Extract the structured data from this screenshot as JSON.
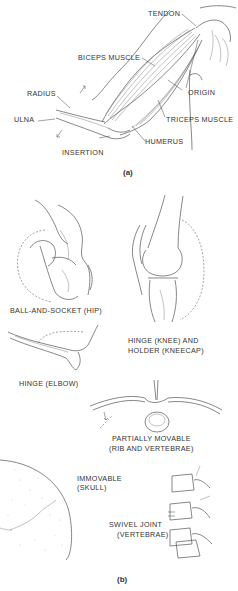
{
  "figure_a": {
    "caption": "(a)",
    "labels": {
      "tendon": "TENDON",
      "biceps": "BICEPS MUSCLE",
      "radius": "RADIUS",
      "origin": "ORIGIN",
      "ulna": "ULNA",
      "triceps": "TRICEPS MUSCLE",
      "humerus": "HUMERUS",
      "insertion": "INSERTION"
    }
  },
  "figure_b": {
    "caption": "(b)",
    "joints": [
      {
        "id": "hip",
        "line1": "BALL-AND-SOCKET  (HIP)",
        "line2": ""
      },
      {
        "id": "knee",
        "line1": "HINGE  (KNEE)  AND",
        "line2": "HOLDER  (KNEECAP)"
      },
      {
        "id": "elbow",
        "line1": "HINGE  (ELBOW)",
        "line2": ""
      },
      {
        "id": "rib",
        "line1": "PARTIALLY  MOVABLE",
        "line2": "(RIB  AND  VERTEBRAE)"
      },
      {
        "id": "skull",
        "line1": "IMMOVABLE",
        "line2": "(SKULL)"
      },
      {
        "id": "vertebrae",
        "line1": "SWIVEL  JOINT",
        "line2": "(VERTEBRAE)"
      }
    ]
  }
}
